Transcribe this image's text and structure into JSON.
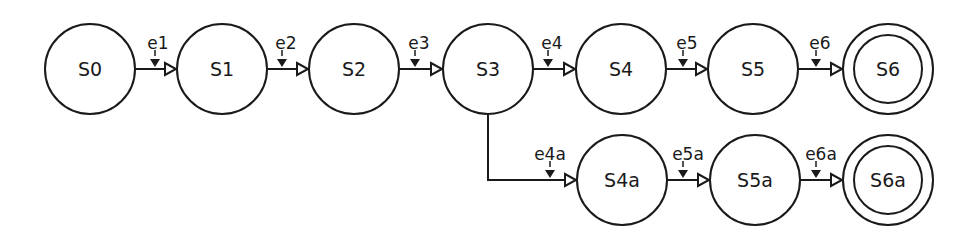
{
  "diagram": {
    "type": "state-machine",
    "states": [
      {
        "id": "S0",
        "label": "S0",
        "cx": 90,
        "cy": 69,
        "final": false
      },
      {
        "id": "S1",
        "label": "S1",
        "cx": 222,
        "cy": 69,
        "final": false
      },
      {
        "id": "S2",
        "label": "S2",
        "cx": 354,
        "cy": 69,
        "final": false
      },
      {
        "id": "S3",
        "label": "S3",
        "cx": 488,
        "cy": 69,
        "final": false
      },
      {
        "id": "S4",
        "label": "S4",
        "cx": 621,
        "cy": 69,
        "final": false
      },
      {
        "id": "S5",
        "label": "S5",
        "cx": 753,
        "cy": 69,
        "final": false
      },
      {
        "id": "S6",
        "label": "S6",
        "cx": 888,
        "cy": 69,
        "final": true
      },
      {
        "id": "S4a",
        "label": "S4a",
        "cx": 622,
        "cy": 180,
        "final": false
      },
      {
        "id": "S5a",
        "label": "S5a",
        "cx": 755,
        "cy": 180,
        "final": false
      },
      {
        "id": "S6a",
        "label": "S6a",
        "cx": 888,
        "cy": 180,
        "final": true
      }
    ],
    "transitions": [
      {
        "label": "e1",
        "from": "S0",
        "to": "S1"
      },
      {
        "label": "e2",
        "from": "S1",
        "to": "S2"
      },
      {
        "label": "e3",
        "from": "S2",
        "to": "S3"
      },
      {
        "label": "e4",
        "from": "S3",
        "to": "S4"
      },
      {
        "label": "e5",
        "from": "S4",
        "to": "S5"
      },
      {
        "label": "e6",
        "from": "S5",
        "to": "S6"
      },
      {
        "label": "e4a",
        "from": "S3",
        "to": "S4a"
      },
      {
        "label": "e5a",
        "from": "S4a",
        "to": "S5a"
      },
      {
        "label": "e6a",
        "from": "S5a",
        "to": "S6a"
      }
    ],
    "style": {
      "stroke_color": "#1a1a1a",
      "fill_color": "#ffffff",
      "radius": 45,
      "final_inner_radius": 34
    }
  }
}
